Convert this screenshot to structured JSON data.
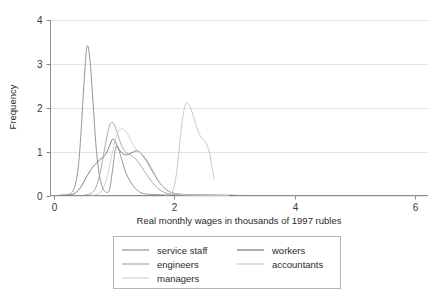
{
  "chart_data": {
    "type": "line",
    "title": "",
    "xlabel": "Real monthly wages in thousands of 1997 rubles",
    "ylabel": "Frequency",
    "xlim": [
      0,
      6
    ],
    "ylim": [
      0,
      4
    ],
    "xticks": [
      "0",
      "2",
      "4",
      "6"
    ],
    "xtick_values": [
      0,
      2,
      4,
      6
    ],
    "yticks": [
      "0",
      "1",
      "2",
      "3",
      "4"
    ],
    "ytick_values": [
      0,
      1,
      2,
      3,
      4
    ],
    "grid": "horizontal",
    "legend_position": "below-center",
    "series": [
      {
        "name": "service staff",
        "color": "#8a8a8a",
        "points": [
          [
            0.1,
            0.01
          ],
          [
            0.2,
            0.02
          ],
          [
            0.28,
            0.05
          ],
          [
            0.34,
            0.18
          ],
          [
            0.4,
            0.6
          ],
          [
            0.45,
            1.45
          ],
          [
            0.5,
            2.6
          ],
          [
            0.55,
            3.4
          ],
          [
            0.6,
            3.05
          ],
          [
            0.65,
            2.1
          ],
          [
            0.7,
            1.1
          ],
          [
            0.75,
            0.5
          ],
          [
            0.8,
            0.2
          ],
          [
            0.86,
            0.08
          ],
          [
            0.92,
            0.12
          ],
          [
            0.97,
            0.55
          ],
          [
            1.02,
            1.05
          ],
          [
            1.06,
            1.1
          ],
          [
            1.12,
            0.85
          ],
          [
            1.2,
            0.5
          ],
          [
            1.3,
            0.25
          ],
          [
            1.4,
            0.1
          ],
          [
            1.5,
            0.04
          ],
          [
            1.7,
            0.02
          ],
          [
            2.0,
            0.01
          ],
          [
            2.6,
            0.01
          ],
          [
            3.2,
            0.0
          ]
        ]
      },
      {
        "name": "workers",
        "color": "#707070",
        "points": [
          [
            0.25,
            0.01
          ],
          [
            0.35,
            0.05
          ],
          [
            0.45,
            0.2
          ],
          [
            0.55,
            0.45
          ],
          [
            0.65,
            0.66
          ],
          [
            0.75,
            0.8
          ],
          [
            0.85,
            0.92
          ],
          [
            0.92,
            1.12
          ],
          [
            0.97,
            1.28
          ],
          [
            1.02,
            1.22
          ],
          [
            1.08,
            1.05
          ],
          [
            1.15,
            0.95
          ],
          [
            1.22,
            0.93
          ],
          [
            1.3,
            0.98
          ],
          [
            1.38,
            1.02
          ],
          [
            1.45,
            0.95
          ],
          [
            1.55,
            0.76
          ],
          [
            1.65,
            0.52
          ],
          [
            1.75,
            0.3
          ],
          [
            1.85,
            0.15
          ],
          [
            1.95,
            0.07
          ],
          [
            2.1,
            0.03
          ],
          [
            2.4,
            0.01
          ],
          [
            3.0,
            0.0
          ]
        ]
      },
      {
        "name": "engineers",
        "color": "#a0a0a0",
        "points": [
          [
            0.5,
            0.01
          ],
          [
            0.6,
            0.04
          ],
          [
            0.68,
            0.14
          ],
          [
            0.75,
            0.42
          ],
          [
            0.82,
            0.9
          ],
          [
            0.88,
            1.35
          ],
          [
            0.93,
            1.62
          ],
          [
            0.98,
            1.66
          ],
          [
            1.03,
            1.52
          ],
          [
            1.1,
            1.22
          ],
          [
            1.18,
            1.0
          ],
          [
            1.26,
            0.93
          ],
          [
            1.34,
            0.86
          ],
          [
            1.42,
            0.72
          ],
          [
            1.52,
            0.52
          ],
          [
            1.62,
            0.32
          ],
          [
            1.72,
            0.17
          ],
          [
            1.82,
            0.08
          ],
          [
            1.95,
            0.03
          ],
          [
            2.2,
            0.01
          ],
          [
            2.8,
            0.0
          ]
        ]
      },
      {
        "name": "accountants",
        "color": "#c2c2c2",
        "points": [
          [
            1.85,
            0.01
          ],
          [
            1.92,
            0.03
          ],
          [
            1.98,
            0.12
          ],
          [
            2.03,
            0.45
          ],
          [
            2.08,
            1.05
          ],
          [
            2.13,
            1.7
          ],
          [
            2.18,
            2.05
          ],
          [
            2.23,
            2.1
          ],
          [
            2.28,
            1.96
          ],
          [
            2.34,
            1.7
          ],
          [
            2.4,
            1.45
          ],
          [
            2.46,
            1.3
          ],
          [
            2.52,
            1.22
          ],
          [
            2.58,
            1.0
          ],
          [
            2.62,
            0.7
          ],
          [
            2.66,
            0.38
          ]
        ]
      },
      {
        "name": "managers",
        "color": "#cfcfcf",
        "points": [
          [
            0.62,
            0.01
          ],
          [
            0.72,
            0.03
          ],
          [
            0.8,
            0.12
          ],
          [
            0.88,
            0.4
          ],
          [
            0.95,
            0.85
          ],
          [
            1.02,
            1.28
          ],
          [
            1.08,
            1.48
          ],
          [
            1.14,
            1.52
          ],
          [
            1.2,
            1.45
          ],
          [
            1.28,
            1.25
          ],
          [
            1.36,
            1.06
          ],
          [
            1.42,
            0.98
          ],
          [
            1.48,
            0.92
          ],
          [
            1.55,
            0.8
          ],
          [
            1.64,
            0.58
          ],
          [
            1.73,
            0.36
          ],
          [
            1.82,
            0.18
          ],
          [
            1.92,
            0.08
          ],
          [
            2.05,
            0.03
          ],
          [
            2.3,
            0.01
          ],
          [
            2.9,
            0.0
          ]
        ]
      }
    ],
    "legend": [
      {
        "label": "service staff",
        "color": "#8a8a8a"
      },
      {
        "label": "workers",
        "color": "#707070"
      },
      {
        "label": "engineers",
        "color": "#a0a0a0"
      },
      {
        "label": "accountants",
        "color": "#c2c2c2"
      },
      {
        "label": "managers",
        "color": "#cfcfcf"
      }
    ]
  },
  "style": {
    "background": "#ffffff",
    "axis_color": "#8c8c8c",
    "grid_color": "#e4e4e4",
    "legend_border": "#b5b5b5",
    "text_color": "#2b2b2b"
  }
}
